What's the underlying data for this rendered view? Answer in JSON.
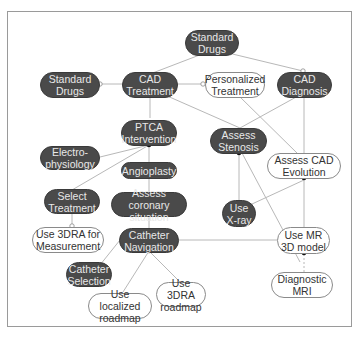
{
  "header": {
    "cut_off_title": ""
  },
  "colors": {
    "dark_node": "#4a4a4a",
    "light_node": "#ffffff",
    "edge": "#b8b8b8",
    "frame": "#9a9a9a"
  },
  "nodes": {
    "standard_drugs_top": "Standard Drugs",
    "standard_drugs_left": "Standard Drugs",
    "cad_treatment": "CAD Treatment",
    "personalized_treatment": "Personalized Treatment",
    "cad_diagnosis": "CAD Diagnosis",
    "ptca_intervention": "PTCA Intervention",
    "assess_stenosis": "Assess Stenosis",
    "electrophysiology": "Electro- physiology",
    "angioplasty": "Angioplasty",
    "assess_cad_evolution": "Assess CAD Evolution",
    "select_treatment": "Select Treatment",
    "assess_coronary_situation": "Assess coronary situation",
    "use_xray": "Use X-ray",
    "use_3dra_measurement": "Use 3DRA for Measurement",
    "catheter_navigation": "Catheter Navigation",
    "use_mr_3d_model": "Use MR 3D model",
    "catheter_selection": "Catheter Selection",
    "diagnostic_mri": "Diagnostic MRI",
    "use_3dra_roadmap": "Use 3DRA roadmap",
    "use_localized_roadmap": "Use localized roadmap"
  }
}
